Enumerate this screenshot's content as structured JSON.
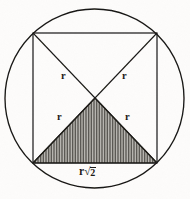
{
  "figure": {
    "background_color": "#fdfcfb",
    "ink_color": "#191714",
    "shade_color": "#7b7872",
    "labels": {
      "radius_top_left": "r",
      "radius_top_right": "r",
      "radius_bottom_left": "r",
      "radius_bottom_right": "r",
      "base_label_symbol": "r",
      "base_label_radical": "√",
      "base_label_radicand": "2",
      "base_label_full": "r√2"
    },
    "geometry": {
      "circle": {
        "cx": 94.5,
        "cy": 98.5,
        "r": 89.5
      },
      "square": {
        "x": 33,
        "y": 33,
        "width": 124,
        "height": 130
      },
      "center_point": {
        "x": 95,
        "y": 98
      },
      "diagonals": [
        {
          "from": [
            33,
            33
          ],
          "to": [
            157,
            163
          ]
        },
        {
          "from": [
            157,
            33
          ],
          "to": [
            33,
            163
          ]
        }
      ],
      "shaded_triangle": {
        "vertices": [
          [
            95,
            98
          ],
          [
            33,
            163
          ],
          [
            157,
            163
          ]
        ],
        "hatch": "vertical-lines",
        "hatch_spacing_px": 1.6
      }
    },
    "label_positions": {
      "radius_top_left": {
        "x": 61,
        "y": 71
      },
      "radius_top_right": {
        "x": 122,
        "y": 71
      },
      "radius_bottom_left": {
        "x": 57,
        "y": 112
      },
      "radius_bottom_right": {
        "x": 125,
        "y": 112
      },
      "base_label": {
        "x": 79,
        "y": 166
      }
    }
  }
}
